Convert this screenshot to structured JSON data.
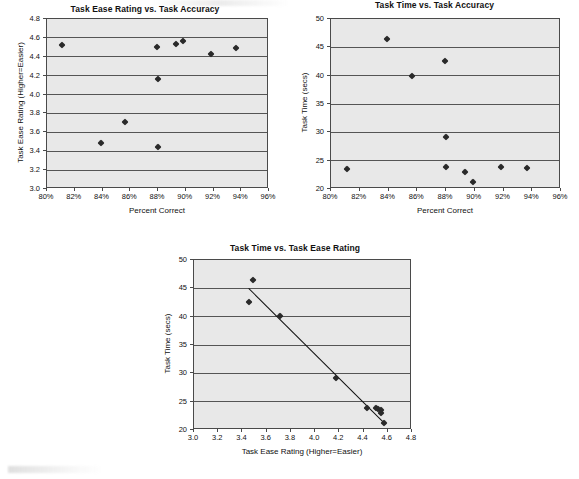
{
  "page": {
    "background": "#ffffff",
    "marker_color": "#2a2a2a",
    "plot_background": "#e8e8e8",
    "axis_color": "#4a4a4a",
    "gridline_color": "#555555",
    "trendline_color": "#111111"
  },
  "charts": [
    {
      "id": "task-ease-vs-accuracy",
      "title": "Task Ease Rating vs. Task Accuracy",
      "xlabel": "Percent Correct",
      "ylabel": "Task Ease Rating (Higher=Easier)",
      "xticks": [
        "80%",
        "82%",
        "84%",
        "86%",
        "88%",
        "90%",
        "92%",
        "94%",
        "96%"
      ],
      "yticks": [
        "3.0",
        "3.2",
        "3.4",
        "3.6",
        "3.8",
        "4.0",
        "4.2",
        "4.4",
        "4.6",
        "4.8"
      ]
    },
    {
      "id": "task-time-vs-accuracy",
      "title": "Task Time vs. Task Accuracy",
      "xlabel": "Percent Correct",
      "ylabel": "Task Time (secs)",
      "xticks": [
        "80%",
        "82%",
        "84%",
        "86%",
        "88%",
        "90%",
        "92%",
        "94%",
        "96%"
      ],
      "yticks": [
        "20",
        "25",
        "30",
        "35",
        "40",
        "45",
        "50"
      ]
    },
    {
      "id": "task-time-vs-task-ease",
      "title": "Task Time vs. Task Ease Rating",
      "xlabel": "Task Ease Rating (Higher=Easier)",
      "ylabel": "Task Time (secs)",
      "xticks": [
        "3.0",
        "3.2",
        "3.4",
        "3.6",
        "3.8",
        "4.0",
        "4.2",
        "4.4",
        "4.6",
        "4.8"
      ],
      "yticks": [
        "20",
        "25",
        "30",
        "35",
        "40",
        "45",
        "50"
      ]
    }
  ],
  "chart_data": [
    {
      "type": "scatter",
      "title": "Task Ease Rating vs. Task Accuracy",
      "xlabel": "Percent Correct",
      "ylabel": "Task Ease Rating (Higher=Easier)",
      "xlim": [
        80,
        96
      ],
      "ylim": [
        3.0,
        4.8
      ],
      "xtick_values": [
        80,
        82,
        84,
        86,
        88,
        90,
        92,
        94,
        96
      ],
      "xtick_labels": [
        "80%",
        "82%",
        "84%",
        "86%",
        "88%",
        "90%",
        "92%",
        "94%",
        "96%"
      ],
      "ytick_values": [
        3.0,
        3.2,
        3.4,
        3.6,
        3.8,
        4.0,
        4.2,
        4.4,
        4.6,
        4.8
      ],
      "ytick_labels": [
        "3.0",
        "3.2",
        "3.4",
        "3.6",
        "3.8",
        "4.0",
        "4.2",
        "4.4",
        "4.6",
        "4.8"
      ],
      "grid": "horizontal",
      "legend": "none",
      "x": [
        81.1,
        83.9,
        85.6,
        87.9,
        88.0,
        88.0,
        89.3,
        89.8,
        91.8,
        93.6
      ],
      "y": [
        4.52,
        3.49,
        3.71,
        4.5,
        4.17,
        3.45,
        4.54,
        4.57,
        4.43,
        4.49
      ]
    },
    {
      "type": "scatter",
      "title": "Task Time vs. Task Accuracy",
      "xlabel": "Percent Correct",
      "ylabel": "Task Time (secs)",
      "xlim": [
        80,
        96
      ],
      "ylim": [
        20,
        50
      ],
      "xtick_values": [
        80,
        82,
        84,
        86,
        88,
        90,
        92,
        94,
        96
      ],
      "xtick_labels": [
        "80%",
        "82%",
        "84%",
        "86%",
        "88%",
        "90%",
        "92%",
        "94%",
        "96%"
      ],
      "ytick_values": [
        20,
        25,
        30,
        35,
        40,
        45,
        50
      ],
      "ytick_labels": [
        "20",
        "25",
        "30",
        "35",
        "40",
        "45",
        "50"
      ],
      "grid": "horizontal",
      "legend": "none",
      "x": [
        81.1,
        83.9,
        85.6,
        87.9,
        88.0,
        88.0,
        89.3,
        89.9,
        91.8,
        93.6
      ],
      "y": [
        23.6,
        46.4,
        40.0,
        42.6,
        29.2,
        23.9,
        23.0,
        21.2,
        23.9,
        23.7
      ]
    },
    {
      "type": "scatter",
      "title": "Task Time vs. Task Ease Rating",
      "xlabel": "Task Ease Rating (Higher=Easier)",
      "ylabel": "Task Time (secs)",
      "xlim": [
        3.0,
        4.8
      ],
      "ylim": [
        20,
        50
      ],
      "xtick_values": [
        3.0,
        3.2,
        3.4,
        3.6,
        3.8,
        4.0,
        4.2,
        4.4,
        4.6,
        4.8
      ],
      "xtick_labels": [
        "3.0",
        "3.2",
        "3.4",
        "3.6",
        "3.8",
        "4.0",
        "4.2",
        "4.4",
        "4.6",
        "4.8"
      ],
      "ytick_values": [
        20,
        25,
        30,
        35,
        40,
        45,
        50
      ],
      "ytick_labels": [
        "20",
        "25",
        "30",
        "35",
        "40",
        "45",
        "50"
      ],
      "grid": "horizontal",
      "legend": "none",
      "x": [
        3.45,
        3.49,
        3.71,
        4.17,
        4.43,
        4.5,
        4.52,
        4.54,
        4.54,
        4.57
      ],
      "y": [
        42.6,
        46.4,
        40.1,
        29.2,
        23.9,
        23.9,
        23.7,
        23.6,
        23.0,
        21.2
      ],
      "trendline": {
        "x0": 3.45,
        "y0": 45.0,
        "x1": 4.58,
        "y1": 21.0
      }
    }
  ]
}
